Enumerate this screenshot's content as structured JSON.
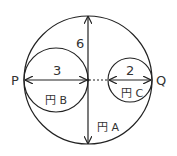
{
  "diagram": {
    "points": {
      "left": "P",
      "right": "Q"
    },
    "dimensions": {
      "circle_a_diameter": "6",
      "circle_b_diameter": "3",
      "circle_c_diameter": "2"
    },
    "circle_labels": {
      "a": "円 A",
      "b": "円 B",
      "c": "円 C"
    },
    "colors": {
      "stroke": "#222222",
      "text": "#333333",
      "background": "#ffffff"
    }
  }
}
